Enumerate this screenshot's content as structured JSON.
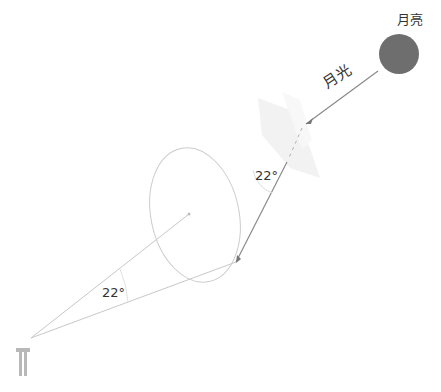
{
  "diagram": {
    "moon": {
      "label": "月亮",
      "color": "#6e6e6e"
    },
    "moonlight": {
      "label": "月光"
    },
    "upper_angle": {
      "label": "22°"
    },
    "lower_angle": {
      "label": "22°"
    },
    "colors": {
      "ray": "#9a9a9a",
      "halo_ring": "#cfcfcf",
      "observer": "#b8b8b8",
      "crystal": "#eeeeee"
    }
  }
}
